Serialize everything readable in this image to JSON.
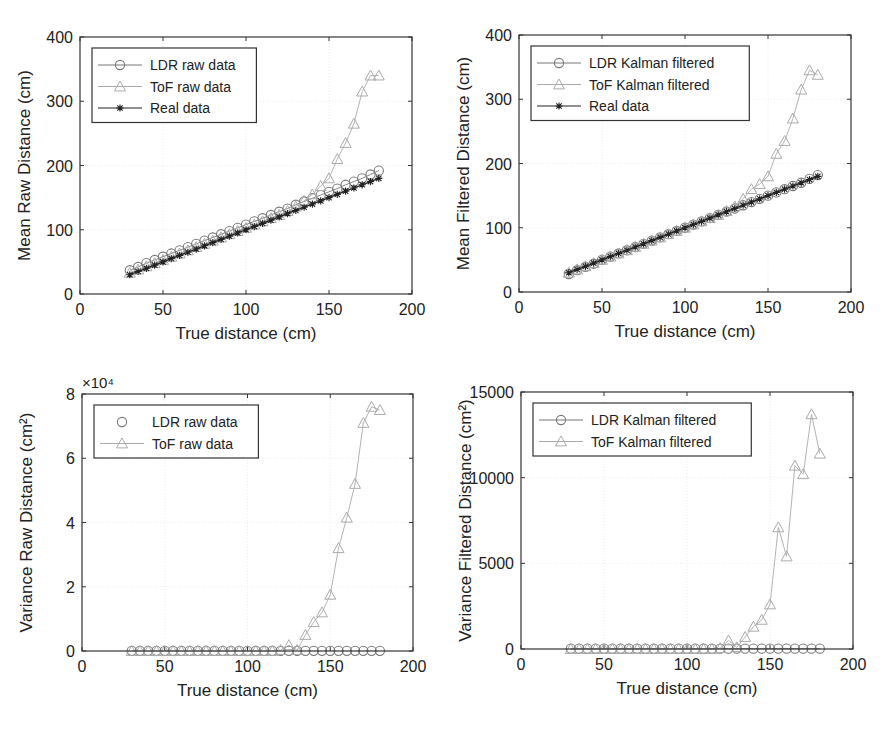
{
  "chart_data": [
    {
      "type": "line",
      "position": "top-left",
      "title": "",
      "xlabel": "True distance (cm)",
      "ylabel": "Mean Raw Distance (cm)",
      "xlim": [
        0,
        200
      ],
      "ylim": [
        0,
        400
      ],
      "xticks": [
        0,
        50,
        100,
        150,
        200
      ],
      "yticks": [
        0,
        100,
        200,
        300,
        400
      ],
      "exponent_label": "",
      "grid": true,
      "legend_position": "upper-left",
      "x": [
        30,
        35,
        40,
        45,
        50,
        55,
        60,
        65,
        70,
        75,
        80,
        85,
        90,
        95,
        100,
        105,
        110,
        115,
        120,
        125,
        130,
        135,
        140,
        145,
        150,
        155,
        160,
        165,
        170,
        175,
        180
      ],
      "series": [
        {
          "name": "LDR raw data",
          "marker": "circle",
          "line": true,
          "color": "#777777",
          "values": [
            37,
            42,
            48,
            53,
            58,
            63,
            68,
            73,
            78,
            83,
            88,
            93,
            98,
            103,
            108,
            113,
            118,
            123,
            128,
            133,
            139,
            144,
            149,
            154,
            159,
            164,
            170,
            175,
            180,
            186,
            192
          ]
        },
        {
          "name": "ToF raw data",
          "marker": "triangle",
          "line": true,
          "color": "#aaaaaa",
          "values": [
            33,
            38,
            43,
            48,
            53,
            58,
            63,
            68,
            73,
            78,
            83,
            88,
            93,
            98,
            103,
            108,
            113,
            118,
            123,
            129,
            136,
            145,
            155,
            168,
            180,
            210,
            235,
            265,
            315,
            340,
            340
          ]
        },
        {
          "name": "Real data",
          "marker": "star",
          "line": true,
          "color": "#222222",
          "values": [
            30,
            35,
            40,
            45,
            50,
            55,
            60,
            65,
            70,
            75,
            80,
            85,
            90,
            95,
            100,
            105,
            110,
            115,
            120,
            125,
            130,
            135,
            140,
            145,
            150,
            155,
            160,
            165,
            170,
            175,
            180
          ]
        }
      ]
    },
    {
      "type": "line",
      "position": "top-right",
      "title": "",
      "xlabel": "True distance (cm)",
      "ylabel": "Mean Filtered Distance (cm)",
      "xlim": [
        0,
        200
      ],
      "ylim": [
        0,
        400
      ],
      "xticks": [
        0,
        50,
        100,
        150,
        200
      ],
      "yticks": [
        0,
        100,
        200,
        300,
        400
      ],
      "exponent_label": "",
      "grid": true,
      "legend_position": "upper-left",
      "x": [
        30,
        35,
        40,
        45,
        50,
        55,
        60,
        65,
        70,
        75,
        80,
        85,
        90,
        95,
        100,
        105,
        110,
        115,
        120,
        125,
        130,
        135,
        140,
        145,
        150,
        155,
        160,
        165,
        170,
        175,
        180
      ],
      "series": [
        {
          "name": "LDR Kalman filtered",
          "marker": "circle",
          "line": true,
          "color": "#777777",
          "values": [
            28,
            34,
            39,
            44,
            50,
            55,
            60,
            65,
            70,
            75,
            80,
            85,
            90,
            95,
            100,
            105,
            110,
            115,
            120,
            125,
            130,
            135,
            140,
            145,
            150,
            155,
            160,
            165,
            170,
            176,
            182
          ]
        },
        {
          "name": "ToF Kalman filtered",
          "marker": "triangle",
          "line": true,
          "color": "#aaaaaa",
          "values": [
            30,
            35,
            40,
            45,
            50,
            55,
            60,
            65,
            70,
            75,
            80,
            85,
            90,
            95,
            100,
            105,
            110,
            115,
            120,
            126,
            133,
            145,
            160,
            168,
            180,
            215,
            235,
            270,
            315,
            345,
            338
          ]
        },
        {
          "name": "Real data",
          "marker": "star",
          "line": true,
          "color": "#222222",
          "values": [
            30,
            35,
            40,
            45,
            50,
            55,
            60,
            65,
            70,
            75,
            80,
            85,
            90,
            95,
            100,
            105,
            110,
            115,
            120,
            125,
            130,
            135,
            140,
            145,
            150,
            155,
            160,
            165,
            170,
            175,
            180
          ]
        }
      ]
    },
    {
      "type": "line",
      "position": "bottom-left",
      "title": "",
      "xlabel": "True distance (cm)",
      "ylabel": "Variance Raw Distance (cm²)",
      "xlim": [
        0,
        200
      ],
      "ylim": [
        0,
        80000
      ],
      "xticks": [
        0,
        50,
        100,
        150,
        200
      ],
      "yticks": [
        0,
        2,
        4,
        6,
        8
      ],
      "exponent_label": "×10⁴",
      "grid": true,
      "legend_position": "upper-left",
      "x": [
        30,
        35,
        40,
        45,
        50,
        55,
        60,
        65,
        70,
        75,
        80,
        85,
        90,
        95,
        100,
        105,
        110,
        115,
        120,
        125,
        130,
        135,
        140,
        145,
        150,
        155,
        160,
        165,
        170,
        175,
        180
      ],
      "series": [
        {
          "name": "LDR raw data",
          "marker": "circle",
          "line": false,
          "color": "#777777",
          "values": [
            50,
            50,
            50,
            50,
            50,
            50,
            50,
            50,
            50,
            50,
            50,
            50,
            50,
            50,
            50,
            50,
            50,
            50,
            50,
            50,
            50,
            50,
            50,
            50,
            50,
            50,
            50,
            50,
            50,
            50,
            50
          ]
        },
        {
          "name": "ToF raw data",
          "marker": "triangle",
          "line": true,
          "color": "#aaaaaa",
          "values": [
            0,
            0,
            0,
            0,
            0,
            0,
            0,
            0,
            0,
            0,
            0,
            0,
            0,
            0,
            0,
            0,
            0,
            0,
            300,
            1800,
            300,
            5000,
            9000,
            12000,
            17500,
            32000,
            41500,
            52000,
            71000,
            76000,
            75000
          ]
        }
      ]
    },
    {
      "type": "line",
      "position": "bottom-right",
      "title": "",
      "xlabel": "True distance (cm)",
      "ylabel": "Variance Filtered Distance (cm²)",
      "xlim": [
        0,
        200
      ],
      "ylim": [
        0,
        15000
      ],
      "xticks": [
        0,
        50,
        100,
        150,
        200
      ],
      "yticks": [
        0,
        5000,
        10000,
        15000
      ],
      "exponent_label": "",
      "grid": true,
      "legend_position": "upper-left",
      "x": [
        30,
        35,
        40,
        45,
        50,
        55,
        60,
        65,
        70,
        75,
        80,
        85,
        90,
        95,
        100,
        105,
        110,
        115,
        120,
        125,
        130,
        135,
        140,
        145,
        150,
        155,
        160,
        165,
        170,
        175,
        180
      ],
      "series": [
        {
          "name": "LDR Kalman filtered",
          "marker": "circle",
          "line": true,
          "color": "#777777",
          "values": [
            20,
            20,
            20,
            20,
            20,
            20,
            20,
            20,
            20,
            20,
            20,
            20,
            20,
            20,
            20,
            20,
            20,
            20,
            20,
            20,
            20,
            20,
            20,
            20,
            20,
            20,
            20,
            20,
            20,
            20,
            20
          ]
        },
        {
          "name": "ToF Kalman filtered",
          "marker": "triangle",
          "line": true,
          "color": "#aaaaaa",
          "values": [
            0,
            0,
            0,
            0,
            0,
            0,
            0,
            0,
            0,
            0,
            0,
            0,
            0,
            0,
            0,
            0,
            0,
            0,
            50,
            500,
            100,
            700,
            1300,
            1700,
            2600,
            7100,
            5400,
            10700,
            10200,
            13700,
            11400
          ]
        }
      ]
    }
  ],
  "layout": {
    "panels": [
      {
        "left": 80,
        "top": 37,
        "right": 412,
        "bottom": 294
      },
      {
        "left": 519,
        "top": 35,
        "right": 851,
        "bottom": 292
      },
      {
        "left": 82,
        "top": 394,
        "right": 413,
        "bottom": 651
      },
      {
        "left": 521,
        "top": 392,
        "right": 853,
        "bottom": 649
      }
    ]
  }
}
